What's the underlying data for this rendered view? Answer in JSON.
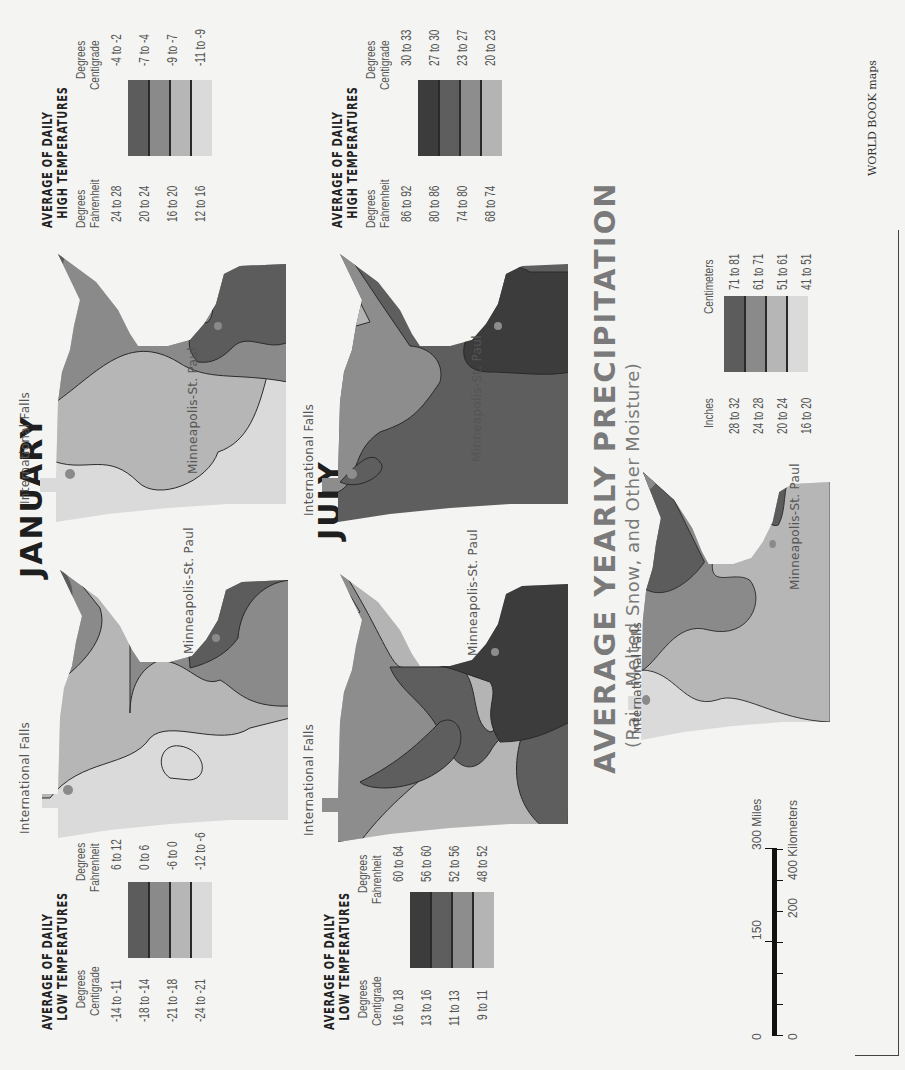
{
  "page": {
    "orientation": "rotated 90° counter-clockwise",
    "credit": "WORLD BOOK maps"
  },
  "colors": {
    "background": "#f4f4f2",
    "shade_1_darkest": "#3c3c3c",
    "shade_2_dark": "#5e5e5e",
    "shade_3_mid": "#8d8d8d",
    "shade_4_light": "#b9b9b9",
    "shade_5_lightest": "#dcdcdc",
    "boundary": "#2a2a2a"
  },
  "sections": {
    "january": {
      "title": "JANUARY",
      "low_map": {
        "labels": {
          "city_north": "International Falls",
          "city_south": "Minneapolis-St. Paul"
        }
      },
      "high_map": {
        "labels": {
          "city_north": "International Falls",
          "city_south": "Minneapolis-St. Paul"
        }
      },
      "low_legend": {
        "title_line1": "AVERAGE OF DAILY",
        "title_line2": "LOW TEMPERATURES",
        "left_header_1": "Degrees",
        "left_header_2": "Centigrade",
        "right_header_1": "Degrees",
        "right_header_2": "Fahrenheit",
        "rows": [
          {
            "left": "-14 to -11",
            "right": "6 to 12",
            "color": "#5c5c5c"
          },
          {
            "left": "-18 to -14",
            "right": "0 to 6",
            "color": "#8a8a8a"
          },
          {
            "left": "-21 to -18",
            "right": "-6 to 0",
            "color": "#b6b6b6"
          },
          {
            "left": "-24 to -21",
            "right": "-12 to -6",
            "color": "#dadada"
          }
        ]
      },
      "high_legend": {
        "title_line1": "AVERAGE OF DAILY",
        "title_line2": "HIGH TEMPERATURES",
        "left_header_1": "Degrees",
        "left_header_2": "Fahrenheit",
        "right_header_1": "Degrees",
        "right_header_2": "Centigrade",
        "rows": [
          {
            "left": "24 to 28",
            "right": "-4 to -2",
            "color": "#5c5c5c"
          },
          {
            "left": "20 to 24",
            "right": "-7 to -4",
            "color": "#8a8a8a"
          },
          {
            "left": "16 to 20",
            "right": "-9 to -7",
            "color": "#b6b6b6"
          },
          {
            "left": "12 to 16",
            "right": "-11 to -9",
            "color": "#dadada"
          }
        ]
      }
    },
    "july": {
      "title": "JULY",
      "low_map": {
        "labels": {
          "city_north": "International Falls",
          "city_south": "Minneapolis-St. Paul"
        }
      },
      "high_map": {
        "labels": {
          "city_north": "International Falls",
          "city_south": "Minneapolis-St. Paul"
        }
      },
      "low_legend": {
        "title_line1": "AVERAGE OF DAILY",
        "title_line2": "LOW TEMPERATURES",
        "left_header_1": "Degrees",
        "left_header_2": "Centigrade",
        "right_header_1": "Degrees",
        "right_header_2": "Fahrenheit",
        "rows": [
          {
            "left": "16 to 18",
            "right": "60 to 64",
            "color": "#3c3c3c"
          },
          {
            "left": "13 to 16",
            "right": "56 to 60",
            "color": "#5e5e5e"
          },
          {
            "left": "11 to 13",
            "right": "52 to 56",
            "color": "#8d8d8d"
          },
          {
            "left": "9 to 11",
            "right": "48 to 52",
            "color": "#b4b4b4"
          }
        ]
      },
      "high_legend": {
        "title_line1": "AVERAGE OF DAILY",
        "title_line2": "HIGH TEMPERATURES",
        "left_header_1": "Degrees",
        "left_header_2": "Fahrenheit",
        "right_header_1": "Degrees",
        "right_header_2": "Centigrade",
        "rows": [
          {
            "left": "86 to 92",
            "right": "30 to 33",
            "color": "#3c3c3c"
          },
          {
            "left": "80 to 86",
            "right": "27 to 30",
            "color": "#5e5e5e"
          },
          {
            "left": "74 to 80",
            "right": "23 to 27",
            "color": "#8d8d8d"
          },
          {
            "left": "68 to 74",
            "right": "20 to 23",
            "color": "#b4b4b4"
          }
        ]
      }
    },
    "precipitation": {
      "title": "AVERAGE YEARLY PRECIPITATION",
      "subtitle": "(Rain, Melted Snow, and Other Moisture)",
      "map": {
        "labels": {
          "city_north": "International Falls",
          "city_south": "Minneapolis-St. Paul"
        }
      },
      "legend": {
        "left_header": "Inches",
        "right_header": "Centimeters",
        "rows": [
          {
            "left": "28 to 32",
            "right": "71 to 81",
            "color": "#5c5c5c"
          },
          {
            "left": "24 to 28",
            "right": "61 to 71",
            "color": "#8a8a8a"
          },
          {
            "left": "20 to 24",
            "right": "51 to 61",
            "color": "#b6b6b6"
          },
          {
            "left": "16 to 20",
            "right": "41 to 51",
            "color": "#dadada"
          }
        ]
      }
    }
  },
  "scale_bar": {
    "miles_ticks": [
      "0",
      "150",
      "300 Miles"
    ],
    "km_ticks": [
      "0",
      "200",
      "400 Kilometers"
    ]
  }
}
